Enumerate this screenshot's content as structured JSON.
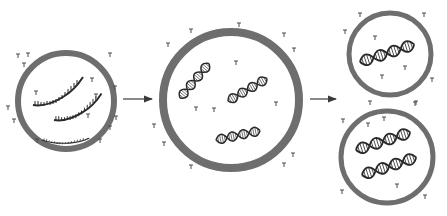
{
  "diagram": {
    "type": "process-flow",
    "description_stages": [
      "protocell-with-template-strands",
      "grown-protocell-with-duplex-dna",
      "divided-daughter-protocells"
    ],
    "colors": {
      "background": "#ffffff",
      "membrane": "#6e6e6e",
      "membrane_inner": "#ffffff",
      "dna": "#2a2a2a",
      "nucleotide": "#4a4a4a",
      "arrow": "#3a3a3a"
    },
    "stages": [
      {
        "id": "stage-1",
        "label": "",
        "cx": 66,
        "cy": 101,
        "r": 48,
        "content": "single-strand-templates",
        "strand_count": 3
      },
      {
        "id": "stage-2",
        "label": "",
        "cx": 231,
        "cy": 100,
        "r": 68,
        "content": "double-helix-dna",
        "helix_count": 3
      },
      {
        "id": "stage-3a",
        "label": "",
        "cx": 390,
        "cy": 54,
        "r": 41,
        "content": "double-helix-dna",
        "helix_count": 1
      },
      {
        "id": "stage-3b",
        "label": "",
        "cx": 387,
        "cy": 157,
        "r": 46,
        "content": "double-helix-dna",
        "helix_count": 2
      }
    ],
    "arrows": [
      {
        "id": "arrow-1",
        "x1": 123,
        "y1": 99,
        "x2": 152,
        "y2": 99
      },
      {
        "id": "arrow-2",
        "x1": 310,
        "y1": 99,
        "x2": 336,
        "y2": 99
      }
    ]
  }
}
